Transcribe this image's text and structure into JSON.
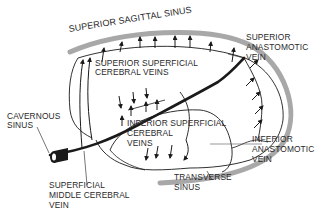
{
  "diagram": {
    "colors": {
      "sinus_band": "#a8a8a8",
      "vein_stroke": "#1a1a1a",
      "text": "#2a2a2a",
      "background": "#ffffff"
    },
    "labels": {
      "superior_sagittal_sinus": "SUPERIOR SAGITTAL SINUS",
      "superior_superficial_cerebral_veins_1": "SUPERIOR SUPERFICIAL",
      "superior_superficial_cerebral_veins_2": "CEREBRAL VEINS",
      "superior_anastomotic_vein_1": "SUPERIOR",
      "superior_anastomotic_vein_2": "ANASTOMOTIC",
      "superior_anastomotic_vein_3": "VEIN",
      "cavernous_sinus_1": "CAVERNOUS",
      "cavernous_sinus_2": "SINUS",
      "inferior_superficial_cerebral_veins_1": "INFERIOR SUPERFICIAL",
      "inferior_superficial_cerebral_veins_2": "CEREBRAL",
      "inferior_superficial_cerebral_veins_3": "VEINS",
      "inferior_anastomotic_vein_1": "INFERIOR",
      "inferior_anastomotic_vein_2": "ANASTOMOTIC",
      "inferior_anastomotic_vein_3": "VEIN",
      "transverse_sinus_1": "TRANSVERSE",
      "transverse_sinus_2": "SINUS",
      "superficial_middle_cerebral_vein_1": "SUPERFICIAL",
      "superficial_middle_cerebral_vein_2": "MIDDLE CEREBRAL",
      "superficial_middle_cerebral_vein_3": "VEIN"
    }
  }
}
